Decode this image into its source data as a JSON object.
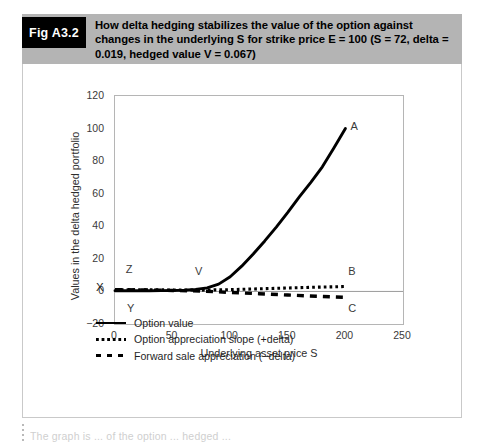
{
  "figure": {
    "badge": "Fig A3.2",
    "caption": "How delta hedging stabilizes the value of the option against changes in the underlying S for strike price E = 100 (S = 72, delta = 0.019, hedged value V = 0.067)"
  },
  "legend": {
    "items": [
      {
        "key": "solid-line-key",
        "label": "Option value"
      },
      {
        "key": "dotted-line-key",
        "label": "Option appreciation slope (+delta)"
      },
      {
        "key": "dashed-line-key",
        "label": "Forward sale appreciation (−delta)"
      }
    ]
  },
  "page_bleed": {
    "text": "The graph is ... of the option ... hedged ..."
  },
  "chart_data": {
    "type": "line",
    "title": "",
    "xlabel": "Underlying asset price S",
    "ylabel": "Values in the delta hedged portfolio",
    "xlim": [
      0,
      250
    ],
    "ylim": [
      -20,
      120
    ],
    "xticks": [
      0,
      50,
      100,
      150,
      200,
      250
    ],
    "yticks": [
      -20,
      0,
      20,
      40,
      60,
      80,
      100,
      120
    ],
    "grid": false,
    "legend_position": "below-plot",
    "axis_origin_label": "X",
    "annotations": [
      {
        "text": "A",
        "x": 207,
        "y": 101
      },
      {
        "text": "Z",
        "x": 12,
        "y": 13
      },
      {
        "text": "V",
        "x": 72,
        "y": 12
      },
      {
        "text": "B",
        "x": 205,
        "y": 12
      },
      {
        "text": "Y",
        "x": 13,
        "y": -11
      },
      {
        "text": "C",
        "x": 205,
        "y": -11
      }
    ],
    "series": [
      {
        "name": "Option value",
        "style": "solid",
        "x": [
          0,
          10,
          20,
          30,
          40,
          50,
          60,
          70,
          80,
          90,
          100,
          110,
          120,
          130,
          140,
          150,
          160,
          170,
          180,
          190,
          200
        ],
        "y": [
          0.4,
          0.4,
          0.4,
          0.4,
          0.5,
          0.6,
          0.8,
          1.2,
          2.2,
          4.5,
          9.0,
          15.5,
          23.0,
          31.0,
          39.5,
          48.5,
          58.0,
          67.0,
          76.5,
          88.0,
          100.0
        ]
      },
      {
        "name": "Option appreciation slope (+delta)",
        "style": "dotted",
        "x": [
          0,
          25,
          50,
          75,
          100,
          125,
          150,
          175,
          200
        ],
        "y": [
          1.1,
          1.0,
          0.9,
          0.8,
          1.1,
          1.6,
          2.1,
          2.6,
          3.0
        ]
      },
      {
        "name": "Forward sale appreciation (−delta)",
        "style": "dashed",
        "x": [
          0,
          25,
          50,
          75,
          100,
          125,
          150,
          175,
          200
        ],
        "y": [
          1.1,
          0.9,
          0.6,
          0.2,
          -0.6,
          -1.4,
          -2.2,
          -3.0,
          -3.6
        ]
      }
    ]
  }
}
